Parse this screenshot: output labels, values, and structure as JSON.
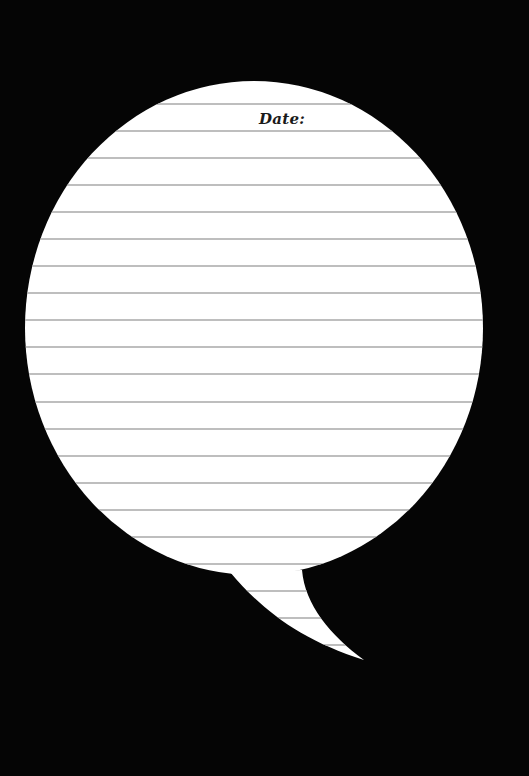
{
  "page": {
    "background_color": "#050505",
    "bubble_color": "#ffffff",
    "rule_color": "#a8a8a8"
  },
  "header": {
    "date_label": "Date:"
  },
  "bubble": {
    "shape": "speech-bubble",
    "ruled_lines": 21
  }
}
